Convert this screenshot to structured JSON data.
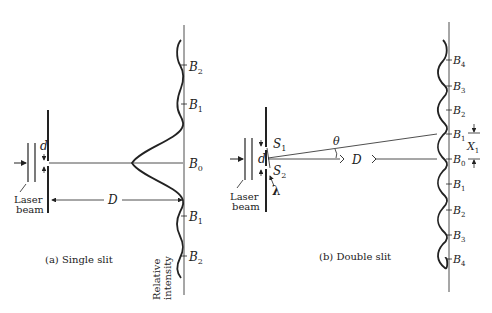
{
  "single_slit": {
    "caption": "(a)  Single slit",
    "slit_width_label": "d",
    "distance_label": "D",
    "laser_label_line1": "Laser",
    "laser_label_line2": "beam",
    "axis_label_line1": "Relative",
    "axis_label_line2": "intensity",
    "bands": [
      {
        "label": "B",
        "sub": "2",
        "pos": "upper"
      },
      {
        "label": "B",
        "sub": "1",
        "pos": "upper"
      },
      {
        "label": "B",
        "sub": "0",
        "pos": "center"
      },
      {
        "label": "B",
        "sub": "1",
        "pos": "lower"
      },
      {
        "label": "B",
        "sub": "2",
        "pos": "lower"
      }
    ]
  },
  "double_slit": {
    "caption": "(b)  Double slit",
    "slit_sep_label": "d",
    "slit1_label": "S",
    "slit1_sub": "1",
    "slit2_label": "S",
    "slit2_sub": "2",
    "wavelength_label": "λ",
    "angle_label": "θ",
    "distance_label": "D",
    "fringe_offset_label": "X",
    "fringe_offset_sub": "1",
    "laser_label_line1": "Laser",
    "laser_label_line2": "beam",
    "bands": [
      {
        "label": "B",
        "sub": "4"
      },
      {
        "label": "B",
        "sub": "3"
      },
      {
        "label": "B",
        "sub": "2"
      },
      {
        "label": "B",
        "sub": "1"
      },
      {
        "label": "B",
        "sub": "0"
      },
      {
        "label": "B",
        "sub": "1"
      },
      {
        "label": "B",
        "sub": "2"
      },
      {
        "label": "B",
        "sub": "3"
      },
      {
        "label": "B",
        "sub": "4"
      }
    ]
  }
}
